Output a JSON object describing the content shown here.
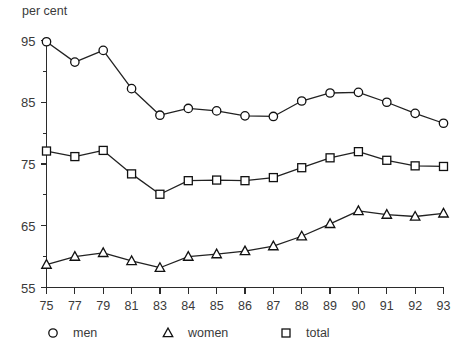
{
  "chart_data": {
    "type": "line",
    "title": "",
    "xlabel": "",
    "ylabel": "per cent",
    "ylim": [
      55,
      95
    ],
    "grid": false,
    "legend_position": "bottom",
    "categories": [
      "75",
      "77",
      "79",
      "81",
      "83",
      "84",
      "85",
      "86",
      "87",
      "88",
      "89",
      "90",
      "91",
      "92",
      "93"
    ],
    "y_ticks_major": [
      "95",
      "85",
      "75",
      "65",
      "55"
    ],
    "y_ticks_major_values": [
      95,
      85,
      75,
      65,
      55
    ],
    "y_ticks_minor_values": [
      90,
      80,
      70,
      60
    ],
    "series": [
      {
        "name": "men",
        "marker": "circle-marker",
        "values": [
          94.8,
          91.5,
          93.4,
          87.2,
          82.9,
          84.0,
          83.6,
          82.8,
          82.7,
          85.2,
          86.5,
          86.6,
          85.0,
          83.2,
          81.6
        ]
      },
      {
        "name": "women",
        "marker": "triangle-marker",
        "values": [
          58.7,
          60.0,
          60.6,
          59.3,
          58.2,
          60.0,
          60.4,
          60.9,
          61.7,
          63.3,
          65.3,
          67.4,
          66.8,
          66.5,
          67.0
        ]
      },
      {
        "name": "total",
        "marker": "square-marker",
        "values": [
          77.1,
          76.2,
          77.2,
          73.4,
          70.1,
          72.3,
          72.4,
          72.3,
          72.8,
          74.4,
          76.0,
          77.0,
          75.6,
          74.7,
          74.6
        ]
      }
    ]
  },
  "legend": {
    "items": [
      {
        "label": "men",
        "marker": "circle-marker"
      },
      {
        "label": "women",
        "marker": "triangle-marker"
      },
      {
        "label": "total",
        "marker": "square-marker"
      }
    ]
  }
}
